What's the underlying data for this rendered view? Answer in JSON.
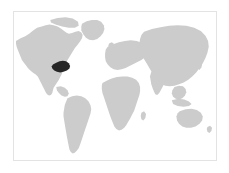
{
  "figure": {
    "kind": "locator-map",
    "title": "World locator map",
    "border_color": "#e3e3e3",
    "background_color": "#ffffff"
  },
  "map": {
    "projection": "equirectangular",
    "ocean_color": "#ffffff",
    "land_color": "#cccccc",
    "highlight_color": "#262626",
    "viewbox": "0 0 612 450",
    "landmasses": [
      {
        "name": "north-america",
        "label": "North America",
        "fill": "#cccccc",
        "path": "M6,88 L20,80 L34,74 L46,66 L58,56 L70,48 L84,44 L96,40 L108,38 L120,40 L132,44 L142,50 L150,56 L158,62 L166,66 L176,64 L186,60 L196,58 L204,62 L208,70 L206,80 L200,90 L192,100 L184,110 L178,120 L172,130 L166,140 L160,150 L156,160 L152,170 L148,180 L144,190 L140,198 L136,206 L132,212 L128,218 L124,224 L120,230 L118,238 L116,246 L112,252 L106,254 L100,250 L96,244 L92,236 L88,228 L84,220 L80,212 L76,204 L72,196 L66,190 L60,186 L54,182 L48,176 L42,170 L36,162 L30,154 L24,146 L20,136 L16,126 L12,116 L8,106 L6,96 Z"
      },
      {
        "name": "greenland",
        "label": "Greenland",
        "fill": "#cccccc",
        "path": "M206,36 L220,28 L236,24 L252,24 L264,30 L272,40 L274,52 L270,64 L262,74 L252,82 L240,86 L228,84 L218,78 L210,68 L204,56 L204,44 Z"
      },
      {
        "name": "south-america",
        "label": "South America",
        "fill": "#cccccc",
        "path": "M162,262 L176,256 L190,254 L204,256 L216,262 L226,272 L232,284 L234,296 L232,308 L228,320 L224,332 L220,344 L216,356 L212,368 L208,380 L204,392 L200,404 L196,414 L190,422 L184,428 L178,430 L172,426 L168,418 L166,408 L164,398 L162,388 L160,378 L158,366 L156,354 L154,342 L152,330 L150,318 L150,306 L152,294 L154,282 L158,272 Z"
      },
      {
        "name": "africa",
        "label": "Africa",
        "fill": "#cccccc",
        "path": "M268,216 L282,208 L296,202 L312,198 L328,196 L344,196 L358,200 L370,206 L378,216 L382,228 L382,240 L380,252 L376,264 L372,276 L368,288 L364,300 L358,312 L352,324 L346,334 L340,344 L334,352 L326,358 L318,360 L310,356 L304,348 L300,338 L296,328 L292,318 L288,306 L284,294 L280,282 L276,270 L272,258 L268,246 L266,234 L266,224 Z"
      },
      {
        "name": "europe",
        "label": "Europe",
        "fill": "#cccccc",
        "path": "M284,106 L300,98 L318,92 L336,88 L354,86 L372,88 L388,94 L400,104 L406,116 L404,128 L396,138 L386,146 L374,152 L362,158 L350,164 L338,170 L326,174 L314,176 L302,174 L292,168 L284,160 L278,150 L276,138 L276,126 L278,114 Z"
      },
      {
        "name": "asia",
        "label": "Asia",
        "fill": "#cccccc",
        "path": "M394,60 L418,52 L444,46 L470,42 L496,40 L522,42 L546,48 L566,58 L580,72 L588,88 L590,106 L586,124 L580,140 L572,156 L562,170 L552,184 L540,196 L528,206 L514,214 L500,220 L486,224 L472,226 L458,224 L446,218 L436,210 L428,200 L422,190 L416,180 L410,170 L404,160 L398,150 L392,140 L386,130 L382,118 L380,106 L380,94 L382,82 L386,70 Z"
      },
      {
        "name": "india",
        "label": "Indian subcontinent",
        "fill": "#cccccc",
        "path": "M416,182 L430,176 L444,174 L456,178 L462,188 L462,200 L458,212 L452,224 L446,236 L440,246 L434,252 L428,250 L424,242 L420,232 L416,220 L414,208 L412,196 Z"
      },
      {
        "name": "southeast-asia",
        "label": "Southeast Asia",
        "fill": "#cccccc",
        "path": "M486,228 L500,224 L512,226 L520,234 L522,244 L518,254 L510,262 L500,266 L490,264 L482,258 L478,248 L480,238 Z"
      },
      {
        "name": "australia",
        "label": "Australia",
        "fill": "#cccccc",
        "path": "M502,302 L520,296 L538,294 L554,298 L566,306 L572,318 L570,330 L562,340 L550,348 L536,352 L522,352 L510,348 L500,340 L494,330 L492,318 L496,308 Z"
      },
      {
        "name": "new-zealand",
        "label": "New Zealand",
        "fill": "#cccccc",
        "path": "M586,350 L594,346 L600,352 L598,362 L592,368 L586,364 L584,356 Z"
      },
      {
        "name": "japan",
        "label": "Japan",
        "fill": "#cccccc",
        "path": "M556,158 L564,152 L570,158 L568,168 L562,176 L556,172 L554,164 Z"
      },
      {
        "name": "british-isles",
        "label": "British Isles",
        "fill": "#cccccc",
        "path": "M288,96 L296,92 L302,96 L302,106 L296,112 L288,110 L286,102 Z"
      },
      {
        "name": "madagascar",
        "label": "Madagascar",
        "fill": "#cccccc",
        "path": "M386,306 L394,302 L400,310 L398,322 L392,330 L386,326 L384,316 Z"
      },
      {
        "name": "indonesia-islands",
        "label": "Indonesian archipelago",
        "fill": "#cccccc",
        "path": "M478,268 L498,264 L516,266 L530,272 L538,280 L530,286 L514,288 L496,286 L482,280 Z"
      },
      {
        "name": "caribbean-central-america",
        "label": "Central America and Caribbean",
        "fill": "#cccccc",
        "path": "M128,228 L142,226 L154,230 L162,238 L166,248 L162,256 L154,258 L144,254 L136,246 L130,238 Z"
      },
      {
        "name": "arctic-islands",
        "label": "Canadian Arctic islands",
        "fill": "#cccccc",
        "path": "M110,24 L132,18 L156,16 L178,20 L194,30 L196,42 L184,48 L166,48 L146,44 L126,38 L112,32 Z"
      }
    ],
    "highlighted_region": {
      "name": "highlighted-state",
      "label": "Highlighted region",
      "description": "Eastern United States / Great Lakes area",
      "fill": "#262626",
      "path": "M118,160 L128,154 L138,150 L148,148 L158,150 L166,156 L170,164 L168,172 L160,178 L150,182 L140,184 L130,182 L122,178 L116,172 L114,166 Z"
    }
  }
}
